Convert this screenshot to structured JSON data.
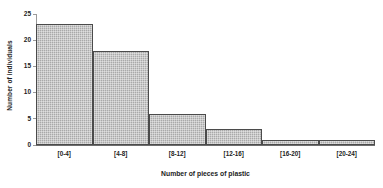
{
  "chart_data": {
    "type": "bar",
    "title": "",
    "subtitle": "",
    "xlabel": "Number of pieces of plastic",
    "ylabel": "Number of individuals",
    "categories": [
      "[0-4]",
      "[4-8]",
      "[8-12]",
      "[12-16]",
      "[16-20]",
      "[20-24]"
    ],
    "values": [
      23,
      18,
      6,
      3,
      1,
      1
    ],
    "ylim": [
      0,
      25
    ],
    "yticks": [
      0,
      5,
      10,
      15,
      20,
      25
    ],
    "ytick_labels": [
      "0",
      "5",
      "10",
      "15",
      "20",
      "25"
    ],
    "grid": false,
    "legend": null,
    "bar_fill_color": "#a9a9a9",
    "bar_edge_color": "#4b4b4b",
    "background_color": "#ffffff",
    "annotations": []
  }
}
